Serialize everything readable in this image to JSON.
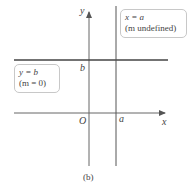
{
  "figure": {
    "caption": "(b)",
    "axes": {
      "x_label": "x",
      "y_label": "y",
      "origin_label": "O"
    },
    "horizontal_line": {
      "label_eq": "y = b",
      "label_slope": "(m = 0)",
      "intercept_label": "b"
    },
    "vertical_line": {
      "label_eq": "x = a",
      "label_slope": "(m undefined)",
      "intercept_label": "a"
    }
  },
  "colors": {
    "line": "#444444",
    "axis": "#666666",
    "box_border": "#c8c8c8"
  }
}
